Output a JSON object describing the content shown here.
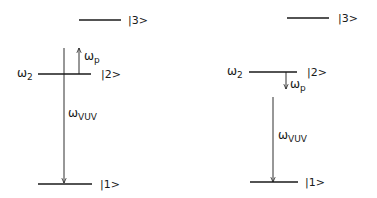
{
  "colors": {
    "ink": "#1a1a1a",
    "background": "#ffffff"
  },
  "panels": [
    {
      "name": "left",
      "levels": [
        {
          "id": "level-3",
          "label": "|3>",
          "x1": 79,
          "x2": 121,
          "y": 20,
          "label_x": 128
        },
        {
          "id": "level-2",
          "label": "|2>",
          "x1": 38,
          "x2": 91,
          "y": 74,
          "label_x": 101,
          "energy_label": "ω",
          "energy_sub": "2",
          "energy_x": 17
        },
        {
          "id": "level-1",
          "label": "|1>",
          "x1": 38,
          "x2": 92,
          "y": 184,
          "label_x": 100
        }
      ],
      "transitions": [
        {
          "id": "probe",
          "symbol": "ω",
          "sub": "p",
          "x": 79,
          "y_from": 74,
          "y_to": 48,
          "direction": "up",
          "label_x": 84,
          "label_y": 60
        },
        {
          "id": "vuv",
          "symbol": "ω",
          "sub": "VUV",
          "x": 64,
          "y_from": 48,
          "y_to": 183,
          "direction": "down",
          "label_x": 68,
          "label_y": 117
        }
      ]
    },
    {
      "name": "right",
      "levels": [
        {
          "id": "level-3",
          "label": "|3>",
          "x1": 287,
          "x2": 329,
          "y": 18,
          "label_x": 338
        },
        {
          "id": "level-2",
          "label": "|2>",
          "x1": 249,
          "x2": 297,
          "y": 72,
          "label_x": 307,
          "energy_label": "ω",
          "energy_sub": "2",
          "energy_x": 227
        },
        {
          "id": "level-1",
          "label": "|1>",
          "x1": 250,
          "x2": 298,
          "y": 182,
          "label_x": 305
        }
      ],
      "transitions": [
        {
          "id": "probe",
          "symbol": "ω",
          "sub": "p",
          "x": 286,
          "y_from": 72,
          "y_to": 89,
          "direction": "down",
          "label_x": 290,
          "label_y": 88
        },
        {
          "id": "vuv",
          "symbol": "ω",
          "sub": "VUV",
          "x": 273,
          "y_from": 97,
          "y_to": 182,
          "direction": "down",
          "label_x": 278,
          "label_y": 139
        }
      ]
    }
  ]
}
